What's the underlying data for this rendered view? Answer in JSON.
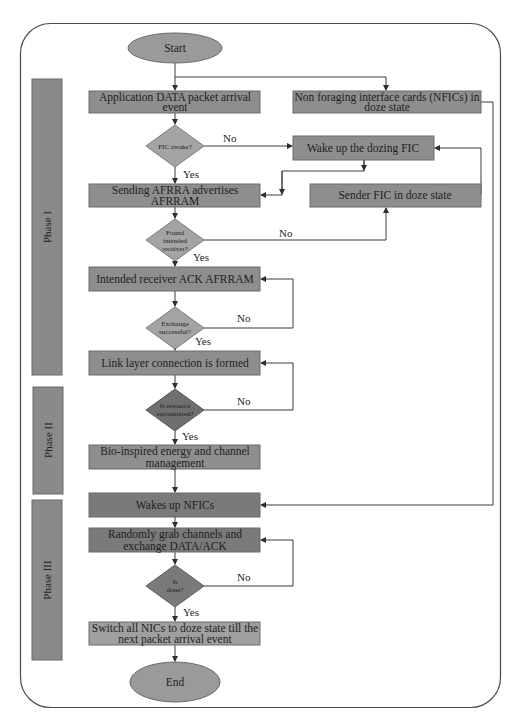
{
  "diagram": {
    "type": "flowchart",
    "colors": {
      "box_medium": "#8e8e8e",
      "box_dark": "#7a7a7a",
      "box_light": "#a0a0a0",
      "diamond_light": "#a4a4a4",
      "diamond_dark": "#6f6f6f",
      "phase_bar": "#8a8a8a",
      "oval": "#9a9a9a",
      "border": "#4a4a4a"
    },
    "terminals": {
      "start": "Start",
      "end": "End"
    },
    "phases": [
      {
        "label": "Phase I"
      },
      {
        "label": "Phase II"
      },
      {
        "label": "Phase III"
      }
    ],
    "processes": {
      "app_data": [
        "Application DATA packet arrival",
        "event"
      ],
      "nfic_doze": [
        "Non foraging interface cards (NFICs) in",
        "doze state"
      ],
      "wake_fic": [
        "Wake up the dozing FIC"
      ],
      "sending_afrra": [
        "Sending AFRRA advertises",
        "AFRRAM"
      ],
      "sender_fic_doze": [
        "Sender FIC in doze state"
      ],
      "receiver_ack": [
        "Intended receiver ACK AFRRAM"
      ],
      "link_layer": [
        "Link layer connection is formed"
      ],
      "bio_inspired": [
        "Bio-inspired energy and channel",
        "management"
      ],
      "wakes_nfics": [
        "Wakes up NFICs"
      ],
      "random_grab": [
        "Randomly grab channels and",
        "exchange DATA/ACK"
      ],
      "switch_doze": [
        "Switch all NICs to doze state till the",
        "next packet arrival event"
      ]
    },
    "decisions": {
      "fic_awake": [
        "FIC awake?"
      ],
      "found_receiver": [
        "Found",
        "intended",
        "receiver?"
      ],
      "exchange_ok": [
        "Exchange",
        "successful?"
      ],
      "resource": [
        "Is resource",
        "encountered?"
      ],
      "done": [
        "Is",
        "done?"
      ]
    },
    "edge_labels": {
      "yes": "Yes",
      "no": "No"
    }
  }
}
